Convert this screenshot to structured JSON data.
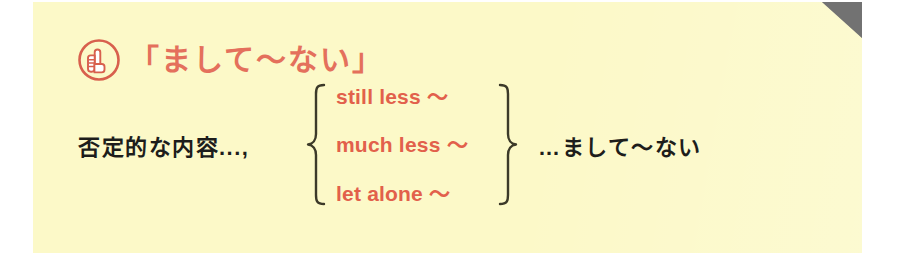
{
  "card": {
    "background_color": "#fcf9c8",
    "corner_fold_color": "#6e6e6e",
    "accent_color": "#e2604b",
    "text_color": "#1d1d1b"
  },
  "heading": {
    "icon": "pointing-hand-icon",
    "title": "「まして～ない」"
  },
  "formula": {
    "lead_phrase": "否定的な内容...,",
    "options": [
      {
        "label": "still less ～"
      },
      {
        "label": "much less ～"
      },
      {
        "label": "let alone ～"
      }
    ],
    "result_phrase": "…まして～ない"
  }
}
